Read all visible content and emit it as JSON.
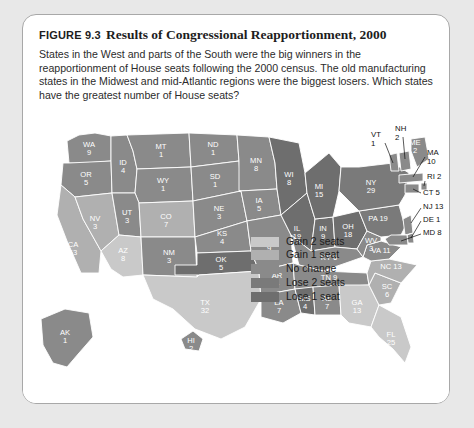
{
  "figure": {
    "number": "FIGURE 9.3",
    "title": "Results of Congressional Reapportionment, 2000",
    "caption": "States in the West and parts of the South were the big winners in the reapportionment of House seats following the 2000 census. The old manufacturing states in the Midwest and mid-Atlantic regions were the biggest losers. Which states have the greatest number of House seats?"
  },
  "legend": {
    "items": [
      {
        "label": "Gain 2 seats",
        "color": "#c9c9c9"
      },
      {
        "label": "Gain 1 seat",
        "color": "#b0b0b0"
      },
      {
        "label": "No change",
        "color": "#8a8a8a"
      },
      {
        "label": "Lose 2 seats",
        "color": "#7a7a7a"
      },
      {
        "label": "Lose 1 seat",
        "color": "#6e6e6e"
      }
    ]
  },
  "chart_data": {
    "type": "map",
    "title": "Results of Congressional Reapportionment, 2000",
    "value_label": "House seats",
    "categories": [
      "Gain 2 seats",
      "Gain 1 seat",
      "No change",
      "Lose 2 seats",
      "Lose 1 seat"
    ],
    "states": [
      {
        "code": "WA",
        "seats": 9,
        "category": "No change",
        "label": "WA",
        "value": "9"
      },
      {
        "code": "OR",
        "seats": 5,
        "category": "No change",
        "label": "OR",
        "value": "5"
      },
      {
        "code": "ID",
        "seats": 4,
        "category": "No change",
        "label": "ID",
        "value": "4"
      },
      {
        "code": "MT",
        "seats": 1,
        "category": "No change",
        "label": "MT",
        "value": "1"
      },
      {
        "code": "WY",
        "seats": 1,
        "category": "No change",
        "label": "WY",
        "value": "1"
      },
      {
        "code": "NV",
        "seats": 3,
        "category": "Gain 1 seat",
        "label": "NV",
        "value": "3"
      },
      {
        "code": "UT",
        "seats": 3,
        "category": "No change",
        "label": "UT",
        "value": "3"
      },
      {
        "code": "CA",
        "seats": 53,
        "category": "Gain 1 seat",
        "label": "CA",
        "value": "53"
      },
      {
        "code": "AZ",
        "seats": 8,
        "category": "Gain 2 seats",
        "label": "AZ",
        "value": "8"
      },
      {
        "code": "CO",
        "seats": 7,
        "category": "Gain 1 seat",
        "label": "CO",
        "value": "7"
      },
      {
        "code": "NM",
        "seats": 3,
        "category": "No change",
        "label": "NM",
        "value": "3"
      },
      {
        "code": "ND",
        "seats": 1,
        "category": "No change",
        "label": "ND",
        "value": "1"
      },
      {
        "code": "SD",
        "seats": 1,
        "category": "No change",
        "label": "SD",
        "value": "1"
      },
      {
        "code": "NE",
        "seats": 3,
        "category": "No change",
        "label": "NE",
        "value": "3"
      },
      {
        "code": "KS",
        "seats": 4,
        "category": "No change",
        "label": "KS",
        "value": "4"
      },
      {
        "code": "OK",
        "seats": 5,
        "category": "Lose 1 seat",
        "label": "OK",
        "value": "5"
      },
      {
        "code": "TX",
        "seats": 32,
        "category": "Gain 2 seats",
        "label": "TX",
        "value": "32"
      },
      {
        "code": "MN",
        "seats": 8,
        "category": "No change",
        "label": "MN",
        "value": "8"
      },
      {
        "code": "IA",
        "seats": 5,
        "category": "No change",
        "label": "IA",
        "value": "5"
      },
      {
        "code": "MO",
        "seats": 9,
        "category": "No change",
        "label": "MO",
        "value": "9"
      },
      {
        "code": "AR",
        "seats": 4,
        "category": "No change",
        "label": "AR",
        "value": "4"
      },
      {
        "code": "LA",
        "seats": 7,
        "category": "No change",
        "label": "LA",
        "value": "7"
      },
      {
        "code": "WI",
        "seats": 8,
        "category": "Lose 1 seat",
        "label": "WI",
        "value": "8"
      },
      {
        "code": "IL",
        "seats": 19,
        "category": "Lose 1 seat",
        "label": "IL",
        "value": "19"
      },
      {
        "code": "MI",
        "seats": 15,
        "category": "Lose 1 seat",
        "label": "MI",
        "value": "15"
      },
      {
        "code": "IN",
        "seats": 9,
        "category": "Lose 1 seat",
        "label": "IN",
        "value": "9"
      },
      {
        "code": "OH",
        "seats": 18,
        "category": "Lose 1 seat",
        "label": "OH",
        "value": "18"
      },
      {
        "code": "KY",
        "seats": 6,
        "category": "No change",
        "label": "KY",
        "value": "6"
      },
      {
        "code": "TN",
        "seats": 9,
        "category": "No change",
        "label": "TN",
        "value": "9"
      },
      {
        "code": "MS",
        "seats": 4,
        "category": "Lose 1 seat",
        "label": "MS",
        "value": "4"
      },
      {
        "code": "AL",
        "seats": 7,
        "category": "No change",
        "label": "AL",
        "value": "7"
      },
      {
        "code": "GA",
        "seats": 13,
        "category": "Gain 2 seats",
        "label": "GA",
        "value": "13"
      },
      {
        "code": "FL",
        "seats": 25,
        "category": "Gain 2 seats",
        "label": "FL",
        "value": "25"
      },
      {
        "code": "SC",
        "seats": 6,
        "category": "Gain 1 seat",
        "label": "SC",
        "value": "6"
      },
      {
        "code": "NC",
        "seats": 13,
        "category": "Gain 1 seat",
        "label": "NC",
        "value": "13"
      },
      {
        "code": "VA",
        "seats": 11,
        "category": "No change",
        "label": "VA",
        "value": "11"
      },
      {
        "code": "WV",
        "seats": 3,
        "category": "No change",
        "label": "WV",
        "value": "3"
      },
      {
        "code": "PA",
        "seats": 19,
        "category": "Lose 2 seats",
        "label": "PA",
        "value": "19"
      },
      {
        "code": "NY",
        "seats": 29,
        "category": "Lose 2 seats",
        "label": "NY",
        "value": "29"
      },
      {
        "code": "AK",
        "seats": 1,
        "category": "No change",
        "label": "AK",
        "value": "1"
      },
      {
        "code": "HI",
        "seats": 2,
        "category": "No change",
        "label": "HI",
        "value": "2"
      }
    ],
    "callout_states": [
      {
        "code": "VT",
        "seats": 1,
        "label": "VT",
        "value": "1",
        "text": "VT"
      },
      {
        "code": "NH",
        "seats": 2,
        "label": "NH",
        "value": "2",
        "text": "NH"
      },
      {
        "code": "ME",
        "seats": 2,
        "label": "ME",
        "value": "2",
        "text": "ME"
      },
      {
        "code": "MA",
        "seats": 10,
        "label": "MA",
        "value": "10",
        "text": "MA"
      },
      {
        "code": "RI",
        "seats": 2,
        "text": "RI 2"
      },
      {
        "code": "CT",
        "seats": 5,
        "text": "CT 5"
      },
      {
        "code": "NJ",
        "seats": 13,
        "text": "NJ 13"
      },
      {
        "code": "DE",
        "seats": 1,
        "text": "DE 1"
      },
      {
        "code": "MD",
        "seats": 8,
        "text": "MD 8"
      }
    ]
  }
}
